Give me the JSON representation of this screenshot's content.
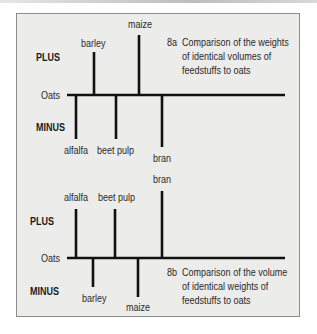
{
  "figure": {
    "background_color": "#ececea",
    "border_color": "#8c8c8c",
    "line_color": "#111111"
  },
  "chart_a": {
    "id": "8a",
    "caption_lines": [
      "Comparison of the weights",
      "of identical volumes of",
      "feedstuffs to oats"
    ],
    "plus_label": "PLUS",
    "minus_label": "MINUS",
    "baseline_label": "Oats",
    "items": [
      {
        "name": "barley",
        "direction": "plus",
        "relative_length": 43
      },
      {
        "name": "maize",
        "direction": "plus",
        "relative_length": 60
      },
      {
        "name": "alfalfa",
        "direction": "minus",
        "relative_length": 44
      },
      {
        "name": "beet pulp",
        "direction": "minus",
        "relative_length": 44
      },
      {
        "name": "bran",
        "direction": "minus",
        "relative_length": 52
      }
    ]
  },
  "chart_b": {
    "id": "8b",
    "caption_lines": [
      "Comparison of the volume",
      "of identical weights of",
      "feedstuffs to oats"
    ],
    "plus_label": "PLUS",
    "minus_label": "MINUS",
    "baseline_label": "Oats",
    "items": [
      {
        "name": "alfalfa",
        "direction": "plus",
        "relative_length": 49
      },
      {
        "name": "beet pulp",
        "direction": "plus",
        "relative_length": 49
      },
      {
        "name": "bran",
        "direction": "plus",
        "relative_length": 67
      },
      {
        "name": "barley",
        "direction": "minus",
        "relative_length": 29
      },
      {
        "name": "maize",
        "direction": "minus",
        "relative_length": 39
      }
    ]
  }
}
